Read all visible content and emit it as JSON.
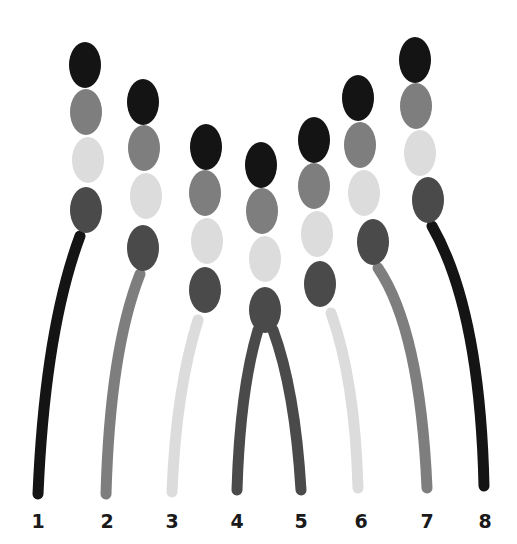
{
  "diagram": {
    "colors": {
      "black": "#141414",
      "dark_gray": "#4a4a4a",
      "mid_gray": "#7e7e7e",
      "light_gray": "#dcdcdc",
      "background": "#ffffff"
    },
    "bead_rx": 16,
    "bead_ry": 23,
    "chains": [
      {
        "label": "1",
        "label_x": 38,
        "beads": [
          {
            "x": 85,
            "y": 65,
            "color": "#141414"
          },
          {
            "x": 86,
            "y": 112,
            "color": "#7e7e7e"
          },
          {
            "x": 88,
            "y": 160,
            "color": "#dcdcdc"
          },
          {
            "x": 86,
            "y": 210,
            "color": "#4a4a4a"
          }
        ],
        "stem": {
          "color": "#141414",
          "path": "M 80 236 Q 45 330 38 494"
        }
      },
      {
        "label": "2",
        "label_x": 107,
        "beads": [
          {
            "x": 143,
            "y": 102,
            "color": "#141414"
          },
          {
            "x": 144,
            "y": 148,
            "color": "#7e7e7e"
          },
          {
            "x": 146,
            "y": 196,
            "color": "#dcdcdc"
          },
          {
            "x": 143,
            "y": 248,
            "color": "#4a4a4a"
          }
        ],
        "stem": {
          "color": "#7e7e7e",
          "path": "M 140 274 Q 110 350 106 494"
        }
      },
      {
        "label": "3",
        "label_x": 172,
        "beads": [
          {
            "x": 206,
            "y": 147,
            "color": "#141414"
          },
          {
            "x": 205,
            "y": 193,
            "color": "#7e7e7e"
          },
          {
            "x": 207,
            "y": 241,
            "color": "#dcdcdc"
          },
          {
            "x": 205,
            "y": 290,
            "color": "#4a4a4a"
          }
        ],
        "stem": {
          "color": "#dcdcdc",
          "path": "M 198 320 Q 176 390 172 492"
        }
      },
      {
        "label": "4",
        "label_x": 237,
        "beads": [
          {
            "x": 261,
            "y": 165,
            "color": "#141414"
          },
          {
            "x": 262,
            "y": 211,
            "color": "#7e7e7e"
          },
          {
            "x": 265,
            "y": 259,
            "color": "#dcdcdc"
          },
          {
            "x": 265,
            "y": 310,
            "color": "#4a4a4a"
          }
        ],
        "stem": {
          "color": "#4a4a4a",
          "path": "M 258 330 Q 240 390 237 490"
        }
      },
      {
        "label": "5",
        "label_x": 301,
        "beads": [
          {
            "x": 314,
            "y": 140,
            "color": "#141414"
          },
          {
            "x": 314,
            "y": 186,
            "color": "#7e7e7e"
          },
          {
            "x": 317,
            "y": 234,
            "color": "#dcdcdc"
          },
          {
            "x": 320,
            "y": 284,
            "color": "#4a4a4a"
          }
        ],
        "stem": {
          "color": "#4a4a4a",
          "path": "M 273 330 Q 295 390 301 490"
        }
      },
      {
        "label": "6",
        "label_x": 361,
        "beads": [
          {
            "x": 358,
            "y": 98,
            "color": "#141414"
          },
          {
            "x": 360,
            "y": 145,
            "color": "#7e7e7e"
          },
          {
            "x": 364,
            "y": 193,
            "color": "#dcdcdc"
          },
          {
            "x": 373,
            "y": 242,
            "color": "#4a4a4a"
          }
        ],
        "stem": {
          "color": "#dcdcdc",
          "path": "M 331 313 Q 355 380 358 488"
        }
      },
      {
        "label": "7",
        "label_x": 427,
        "beads": [
          {
            "x": 415,
            "y": 60,
            "color": "#141414"
          },
          {
            "x": 416,
            "y": 106,
            "color": "#7e7e7e"
          },
          {
            "x": 420,
            "y": 153,
            "color": "#dcdcdc"
          },
          {
            "x": 428,
            "y": 200,
            "color": "#4a4a4a"
          }
        ],
        "stem": {
          "color": "#7e7e7e",
          "path": "M 378 268 Q 420 330 427 488"
        }
      },
      {
        "label": "8",
        "label_x": 485,
        "beads": [],
        "stem": {
          "color": "#141414",
          "path": "M 432 226 Q 480 310 484 486"
        }
      }
    ],
    "label_y": 528
  }
}
